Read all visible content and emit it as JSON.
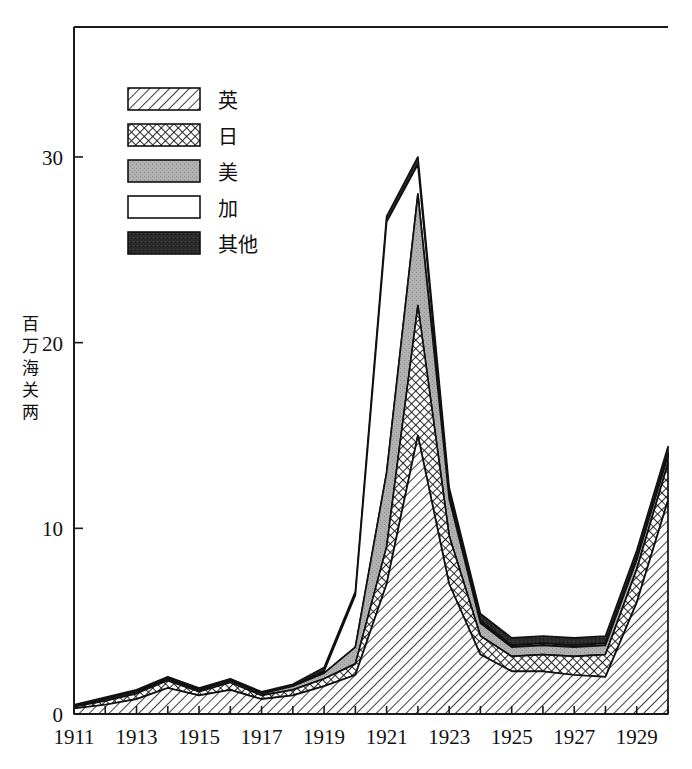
{
  "chart_data": {
    "type": "area",
    "stacked": true,
    "title": "",
    "subtitle": "",
    "xlabel": "",
    "ylabel": "百万海关两",
    "xlim": [
      1911,
      1930
    ],
    "ylim": [
      0,
      37
    ],
    "grid": false,
    "legend_position": "top-left",
    "x": [
      1911,
      1912,
      1913,
      1914,
      1915,
      1916,
      1917,
      1918,
      1919,
      1920,
      1921,
      1922,
      1923,
      1924,
      1925,
      1926,
      1927,
      1928,
      1929,
      1930
    ],
    "categories": [
      "1911",
      "1912",
      "1913",
      "1914",
      "1915",
      "1916",
      "1917",
      "1918",
      "1919",
      "1920",
      "1921",
      "1922",
      "1923",
      "1924",
      "1925",
      "1926",
      "1927",
      "1928",
      "1929",
      "1930"
    ],
    "x_tick_labels": [
      "1911",
      "1913",
      "1915",
      "1917",
      "1919",
      "1921",
      "1923",
      "1925",
      "1927",
      "1929"
    ],
    "x_tick_values": [
      1911,
      1913,
      1915,
      1917,
      1919,
      1921,
      1923,
      1925,
      1927,
      1929
    ],
    "y_tick_labels": [
      "0",
      "10",
      "20",
      "30"
    ],
    "y_tick_values": [
      0,
      10,
      20,
      30
    ],
    "series": [
      {
        "name": "英",
        "fill": "diagonal-hatch",
        "values": [
          0.3,
          0.5,
          0.8,
          1.4,
          1.0,
          1.3,
          0.8,
          1.0,
          1.5,
          2.1,
          7.0,
          15.0,
          7.0,
          3.2,
          2.3,
          2.3,
          2.1,
          2.0,
          6.0,
          11.5
        ]
      },
      {
        "name": "日",
        "fill": "crosshatch",
        "values": [
          0.1,
          0.2,
          0.3,
          0.4,
          0.2,
          0.4,
          0.2,
          0.3,
          0.4,
          0.6,
          2.0,
          7.0,
          2.6,
          1.0,
          0.8,
          0.9,
          1.0,
          1.2,
          1.8,
          2.0
        ]
      },
      {
        "name": "美",
        "fill": "gray-solid",
        "values": [
          0.05,
          0.1,
          0.1,
          0.1,
          0.1,
          0.1,
          0.1,
          0.2,
          0.3,
          0.9,
          4.0,
          6.0,
          2.0,
          0.7,
          0.5,
          0.5,
          0.5,
          0.5,
          0.5,
          0.4
        ]
      },
      {
        "name": "加",
        "fill": "white",
        "values": [
          0.0,
          0.0,
          0.0,
          0.0,
          0.0,
          0.0,
          0.0,
          0.0,
          0.1,
          2.8,
          13.5,
          1.6,
          0.2,
          0.1,
          0.1,
          0.1,
          0.1,
          0.1,
          0.1,
          0.1
        ]
      },
      {
        "name": "其他",
        "fill": "black-solid",
        "values": [
          0.05,
          0.1,
          0.1,
          0.1,
          0.1,
          0.1,
          0.1,
          0.1,
          0.2,
          0.2,
          0.3,
          0.4,
          0.4,
          0.4,
          0.4,
          0.4,
          0.4,
          0.4,
          0.4,
          0.4
        ]
      }
    ],
    "stack_totals": [
      0.5,
      0.9,
      1.3,
      2.0,
      1.4,
      1.9,
      1.2,
      1.6,
      2.5,
      6.6,
      26.8,
      30.0,
      12.2,
      5.4,
      4.1,
      4.2,
      4.1,
      4.2,
      8.8,
      14.4
    ]
  },
  "axis": {
    "y_title": "百万海关两",
    "y_title_chars": [
      "百",
      "万",
      "海",
      "关",
      "两"
    ]
  },
  "legend": {
    "entries": [
      {
        "label": "英",
        "pattern": "diagonal-hatch"
      },
      {
        "label": "日",
        "pattern": "crosshatch"
      },
      {
        "label": "美",
        "pattern": "gray-solid"
      },
      {
        "label": "加",
        "pattern": "white"
      },
      {
        "label": "其他",
        "pattern": "black-solid"
      }
    ]
  },
  "colors": {
    "axis": "#1a1a1a",
    "text": "#111111",
    "gray_fill": "#b0b0b0",
    "black_fill": "#2b2b2b",
    "white_fill": "#ffffff",
    "background": "#ffffff"
  }
}
